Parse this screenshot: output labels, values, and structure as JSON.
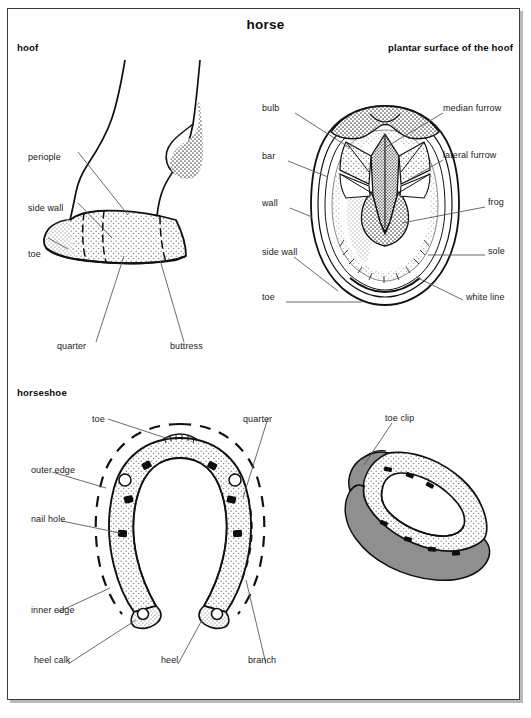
{
  "page": {
    "title": "horse",
    "width": 531,
    "height": 718,
    "border_color": "#3a3a3a",
    "background": "#ffffff",
    "ink_color": "#1a1a1a"
  },
  "sections": {
    "hoof": {
      "heading": "hoof"
    },
    "plantar": {
      "heading": "plantar surface of the hoof"
    },
    "horseshoe": {
      "heading": "horseshoe"
    }
  },
  "hoof_labels": [
    {
      "id": "periople",
      "text": "periople",
      "x": 28,
      "y": 152,
      "align": "left"
    },
    {
      "id": "side-wall",
      "text": "side wall",
      "x": 28,
      "y": 203,
      "align": "left"
    },
    {
      "id": "toe",
      "text": "toe",
      "x": 28,
      "y": 249,
      "align": "left"
    },
    {
      "id": "quarter",
      "text": "quarter",
      "x": 57,
      "y": 345,
      "align": "left"
    },
    {
      "id": "buttress",
      "text": "buttress",
      "x": 170,
      "y": 345,
      "align": "left"
    }
  ],
  "plantar_labels_left": [
    {
      "id": "bulb",
      "text": "bulb",
      "x": 262,
      "y": 108,
      "align": "left"
    },
    {
      "id": "bar",
      "text": "bar",
      "x": 262,
      "y": 156,
      "align": "left"
    },
    {
      "id": "wall",
      "text": "wall",
      "x": 262,
      "y": 203,
      "align": "left"
    },
    {
      "id": "side-wall",
      "text": "side wall",
      "x": 262,
      "y": 252,
      "align": "left"
    },
    {
      "id": "toe",
      "text": "toe",
      "x": 262,
      "y": 297,
      "align": "left"
    }
  ],
  "plantar_labels_right": [
    {
      "id": "median-furrow",
      "text": "median furrow",
      "x": 443,
      "y": 108,
      "align": "left"
    },
    {
      "id": "lateral-furrow",
      "text": "lateral furrow",
      "x": 443,
      "y": 155,
      "align": "left"
    },
    {
      "id": "frog",
      "text": "frog",
      "x": 488,
      "y": 202,
      "align": "left"
    },
    {
      "id": "sole",
      "text": "sole",
      "x": 488,
      "y": 251,
      "align": "left"
    },
    {
      "id": "white-line",
      "text": "white line",
      "x": 466,
      "y": 297,
      "align": "left"
    }
  ],
  "horseshoe_labels": [
    {
      "id": "toe",
      "text": "toe",
      "x": 92,
      "y": 417,
      "align": "left"
    },
    {
      "id": "quarter",
      "text": "quarter",
      "x": 243,
      "y": 417,
      "align": "left"
    },
    {
      "id": "outer-edge",
      "text": "outer edge",
      "x": 32,
      "y": 468,
      "align": "left"
    },
    {
      "id": "nail-hole",
      "text": "nail hole",
      "x": 32,
      "y": 517,
      "align": "left"
    },
    {
      "id": "inner-edge",
      "text": "inner edge",
      "x": 32,
      "y": 608,
      "align": "left"
    },
    {
      "id": "heel-calk",
      "text": "heel calk",
      "x": 34,
      "y": 658,
      "align": "left"
    },
    {
      "id": "heel",
      "text": "heel",
      "x": 161,
      "y": 658,
      "align": "left"
    },
    {
      "id": "branch",
      "text": "branch",
      "x": 248,
      "y": 658,
      "align": "left"
    }
  ],
  "toeclip_labels": [
    {
      "id": "toe-clip",
      "text": "toe clip",
      "x": 385,
      "y": 417,
      "align": "left"
    }
  ],
  "figure_fills": {
    "stipple_light": "#d6d6d6",
    "stipple_mid": "#bcbcbc",
    "stipple_dark": "#9a9a9a",
    "outline": "#111111",
    "white": "#ffffff"
  }
}
